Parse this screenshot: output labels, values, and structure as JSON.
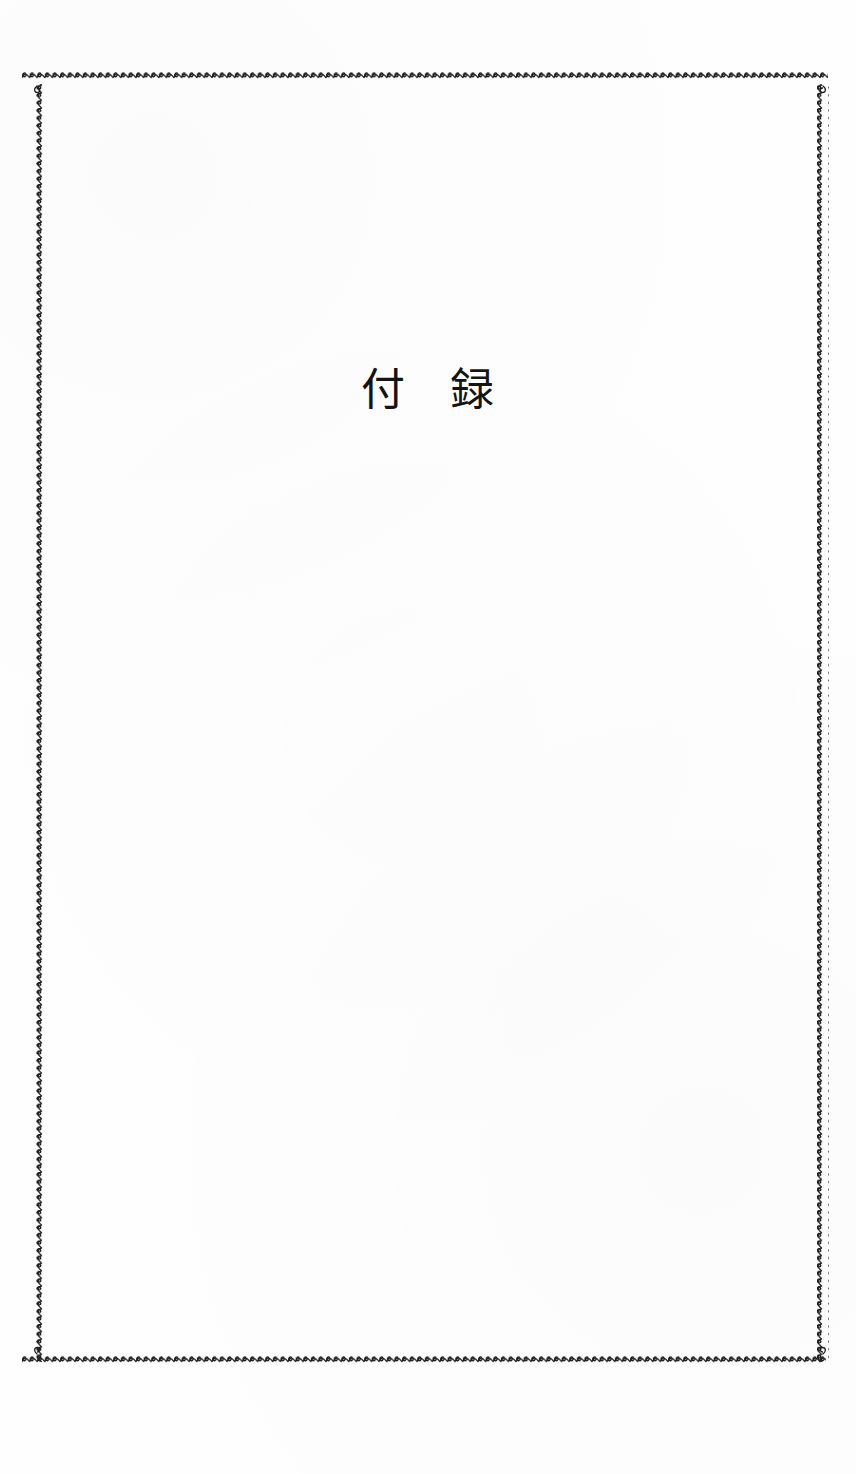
{
  "document": {
    "page_background_color": "#ffffff",
    "ink_color": "#1a1a1a",
    "page_width": 856,
    "page_height": 1474
  },
  "frame": {
    "name": "ornamental-wavy-border",
    "style": "repeating curled rope / scalloped squiggle line",
    "color": "#1f1f1f",
    "left": 37,
    "top": 77,
    "right": 823,
    "bottom": 1362
  },
  "title": {
    "text": "付　録",
    "reading": "furoku",
    "meaning": "Appendix",
    "characters": [
      "付",
      "録"
    ],
    "color": "#141414"
  },
  "body": {
    "content": "",
    "note": ""
  }
}
